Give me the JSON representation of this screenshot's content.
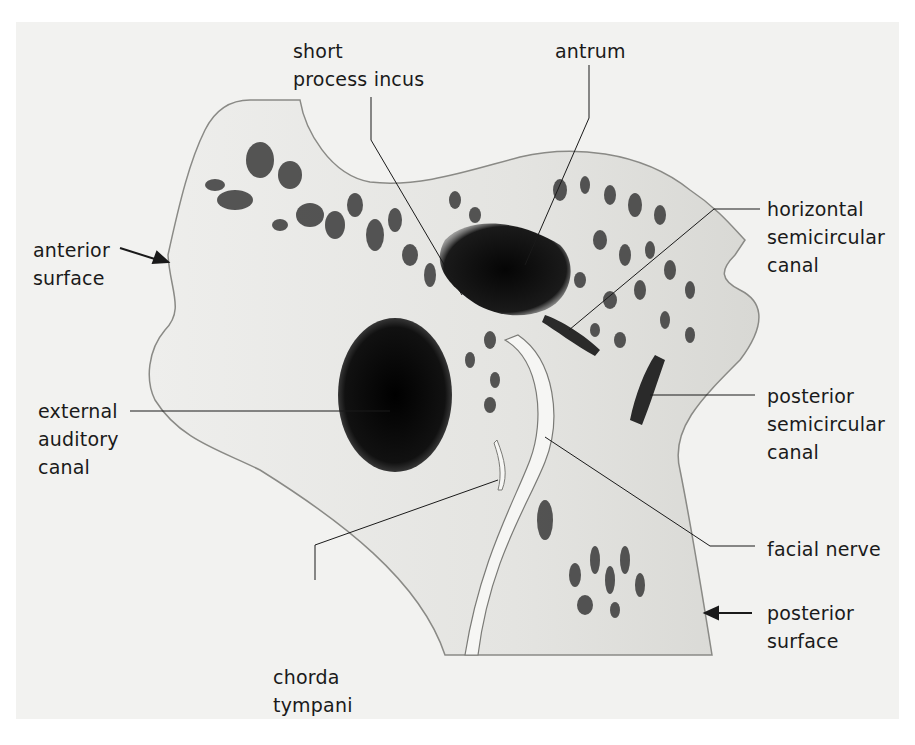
{
  "diagram": {
    "background_color": "#f2f2f0",
    "bone_color": "#e6e6e2",
    "cavity_color": "#0a0a0a",
    "labels": {
      "short_process_incus": {
        "line1": "short",
        "line2": "process incus"
      },
      "antrum": {
        "line1": "antrum"
      },
      "horizontal_semicircular_canal": {
        "line1": "horizontal",
        "line2": "semicircular",
        "line3": "canal"
      },
      "anterior_surface": {
        "line1": "anterior",
        "line2": "surface"
      },
      "external_auditory_canal": {
        "line1": "external",
        "line2": "auditory",
        "line3": "canal"
      },
      "posterior_semicircular_canal": {
        "line1": "posterior",
        "line2": "semicircular",
        "line3": "canal"
      },
      "facial_nerve": {
        "line1": "facial nerve"
      },
      "posterior_surface": {
        "line1": "posterior",
        "line2": "surface"
      },
      "chorda_tympani": {
        "line1": "chorda",
        "line2": "tympani"
      }
    }
  }
}
